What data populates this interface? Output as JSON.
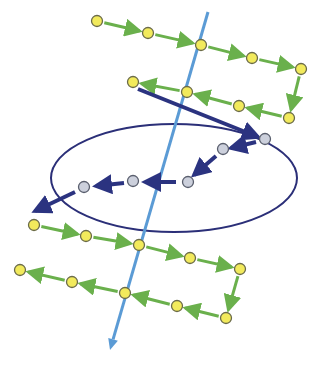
{
  "canvas": {
    "width": 323,
    "height": 371,
    "background": "#ffffff"
  },
  "colors": {
    "axis": "#5b9bd5",
    "chain_arrow": "#6ab04c",
    "node_fill": "#f2ea5c",
    "node_stroke": "#6b6b4a",
    "gray_node_fill": "#ccd0dc",
    "gray_node_stroke": "#5a5f6e",
    "navy": "#2b3380",
    "ellipse": "#2b2f78"
  },
  "axis": {
    "x1": 208,
    "y1": 12,
    "x2": 110,
    "y2": 350,
    "head_size": 11
  },
  "ellipse": {
    "cx": 174,
    "cy": 178,
    "rx": 123,
    "ry": 54,
    "rotate": 0
  },
  "chains": [
    {
      "name": "top-row-1",
      "direction": "right",
      "nodes": [
        [
          97,
          21
        ],
        [
          148,
          33
        ],
        [
          201,
          45
        ],
        [
          252,
          58
        ],
        [
          301,
          69
        ]
      ]
    },
    {
      "name": "top-connector",
      "direction": "down",
      "nodes": [
        [
          301,
          69
        ],
        [
          289,
          118
        ]
      ],
      "hide_nodes": true
    },
    {
      "name": "top-row-2",
      "direction": "left",
      "nodes": [
        [
          289,
          118
        ],
        [
          239,
          106
        ],
        [
          187,
          92
        ],
        [
          133,
          82
        ]
      ]
    },
    {
      "name": "bottom-row-1",
      "direction": "right",
      "nodes": [
        [
          34,
          225
        ],
        [
          86,
          236
        ],
        [
          139,
          245
        ],
        [
          190,
          258
        ],
        [
          240,
          269
        ]
      ]
    },
    {
      "name": "bottom-connector",
      "direction": "down",
      "nodes": [
        [
          240,
          269
        ],
        [
          226,
          318
        ]
      ],
      "hide_nodes": true
    },
    {
      "name": "bottom-row-2",
      "direction": "left",
      "nodes": [
        [
          226,
          318
        ],
        [
          177,
          306
        ],
        [
          125,
          293
        ],
        [
          72,
          282
        ],
        [
          20,
          270
        ]
      ]
    }
  ],
  "gray_nodes": [
    [
      265,
      139
    ],
    [
      223,
      149
    ],
    [
      188,
      182
    ],
    [
      133,
      181
    ],
    [
      84,
      187
    ]
  ],
  "navy_arrows": [
    {
      "from": [
        138,
        89
      ],
      "to": [
        258,
        137
      ],
      "width": 4
    },
    {
      "from": [
        256,
        142
      ],
      "to": [
        231,
        148
      ],
      "width": 4
    },
    {
      "from": [
        216,
        156
      ],
      "to": [
        194,
        175
      ],
      "width": 4
    },
    {
      "from": [
        176,
        182
      ],
      "to": [
        145,
        182
      ],
      "width": 4
    },
    {
      "from": [
        124,
        183
      ],
      "to": [
        96,
        186
      ],
      "width": 4
    },
    {
      "from": [
        75,
        192
      ],
      "to": [
        35,
        211
      ],
      "width": 4
    }
  ],
  "node_radius": 5.5,
  "gray_node_radius": 5.5
}
